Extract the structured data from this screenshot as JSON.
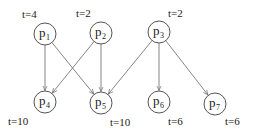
{
  "diagram": {
    "type": "task-dependency-graph",
    "nodes": [
      {
        "id": "p1",
        "base": "p",
        "sub": "1",
        "time": "t=4",
        "x": 45,
        "y": 34,
        "tx": 22,
        "ty": 18
      },
      {
        "id": "p2",
        "base": "p",
        "sub": "2",
        "time": "t=2",
        "x": 101,
        "y": 33,
        "tx": 76,
        "ty": 17
      },
      {
        "id": "p3",
        "base": "p",
        "sub": "3",
        "time": "t=2",
        "x": 159,
        "y": 32,
        "tx": 168,
        "ty": 17
      },
      {
        "id": "p4",
        "base": "p",
        "sub": "4",
        "time": "t=10",
        "x": 45,
        "y": 102,
        "tx": 8,
        "ty": 125
      },
      {
        "id": "p5",
        "base": "p",
        "sub": "5",
        "time": "t=10",
        "x": 101,
        "y": 103,
        "tx": 110,
        "ty": 126
      },
      {
        "id": "p6",
        "base": "p",
        "sub": "6",
        "time": "t=6",
        "x": 159,
        "y": 102,
        "tx": 168,
        "ty": 125
      },
      {
        "id": "p7",
        "base": "p",
        "sub": "7",
        "time": "t=6",
        "x": 215,
        "y": 104,
        "tx": 225,
        "ty": 125
      }
    ],
    "edges": [
      {
        "from": "p1",
        "to": "p4"
      },
      {
        "from": "p1",
        "to": "p5"
      },
      {
        "from": "p2",
        "to": "p4"
      },
      {
        "from": "p2",
        "to": "p5"
      },
      {
        "from": "p3",
        "to": "p5"
      },
      {
        "from": "p3",
        "to": "p6"
      },
      {
        "from": "p3",
        "to": "p7"
      }
    ],
    "node_radius": 11,
    "colors": {
      "stroke": "#555555",
      "edge": "#777777",
      "text": "#222222"
    }
  }
}
